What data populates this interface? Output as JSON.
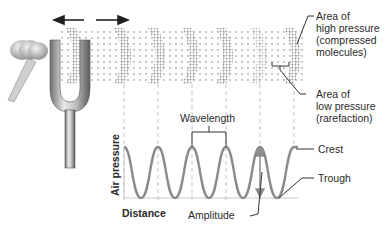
{
  "diagram": {
    "vibration_arrows": [
      "left",
      "right"
    ],
    "labels": {
      "high_pressure": [
        "Area of",
        "high pressure",
        "(compressed",
        "molecules)"
      ],
      "low_pressure": [
        "Area of",
        "low pressure",
        "(rarefaction)"
      ],
      "wavelength": "Wavelength",
      "crest": "Crest",
      "trough": "Trough",
      "amplitude": "Amplitude",
      "y_axis": "Air pressure",
      "x_axis": "Distance"
    },
    "compression_bands": 6,
    "colors": {
      "wave": "#8a8a8a",
      "particles": "#9a9a9a",
      "dashed_lines": "#b5b5b5",
      "leader_lines": "#333333",
      "text": "#2a2a2a"
    }
  }
}
